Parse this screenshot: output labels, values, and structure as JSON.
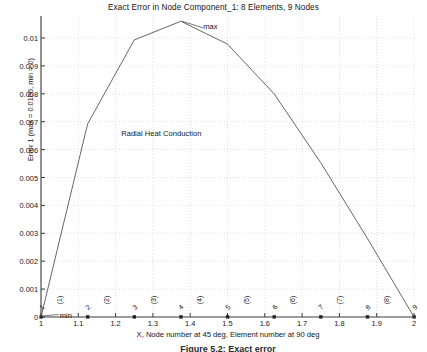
{
  "chart_data": {
    "type": "line",
    "title": "Exact Error in Node Component_1:   8 Elements, 9 Nodes",
    "xlabel": "X, Node number at 45 deg, Element number at 90 deg",
    "ylabel": "Error 1 (max = 0.0106, min = 0)",
    "grid": true,
    "legend": "none",
    "xlim": [
      1,
      2
    ],
    "ylim": [
      0,
      0.0106
    ],
    "xticks": [
      "1",
      "1.1",
      "1.2",
      "1.3",
      "1.4",
      "1.5",
      "1.6",
      "1.7",
      "1.8",
      "1.9",
      "2"
    ],
    "xtick_values": [
      1,
      1.1,
      1.2,
      1.3,
      1.4,
      1.5,
      1.6,
      1.7,
      1.8,
      1.9,
      2
    ],
    "yticks": [
      "0",
      "0.001",
      "0.002",
      "0.003",
      "0.004",
      "0.005",
      "0.006",
      "0.007",
      "0.008",
      "0.009",
      "0.01"
    ],
    "ytick_values": [
      0,
      0.001,
      0.002,
      0.003,
      0.004,
      0.005,
      0.006,
      0.007,
      0.008,
      0.009,
      0.01
    ],
    "x": [
      1,
      1.125,
      1.25,
      1.375,
      1.5,
      1.625,
      1.75,
      1.875,
      2
    ],
    "values": [
      0,
      0.00692,
      0.00993,
      0.0106,
      0.00978,
      0.008,
      0.00553,
      0.00282,
      0
    ],
    "series": [
      {
        "name": "Error 1",
        "x": [
          1,
          1.125,
          1.25,
          1.375,
          1.5,
          1.625,
          1.75,
          1.875,
          2
        ],
        "values": [
          0,
          0.00692,
          0.00993,
          0.0106,
          0.00978,
          0.008,
          0.00553,
          0.00282,
          0
        ],
        "color": "#555555"
      }
    ],
    "node_markers": {
      "x": [
        1,
        1.125,
        1.25,
        1.375,
        1.5,
        1.625,
        1.75,
        1.875,
        2
      ],
      "y": [
        0,
        0,
        0,
        0,
        0,
        0,
        0,
        0,
        0
      ],
      "labels": [
        "1",
        "2",
        "3",
        "4",
        "5",
        "6",
        "7",
        "8",
        "9"
      ],
      "rotation_deg": 45,
      "color": "#222222"
    },
    "element_markers": {
      "x": [
        1.0625,
        1.1875,
        1.3125,
        1.4375,
        1.5625,
        1.6875,
        1.8125,
        1.9375
      ],
      "labels": [
        "(1)",
        "(2)",
        "(3)",
        "(4)",
        "(5)",
        "(6)",
        "(7)",
        "(8)"
      ],
      "rotation_deg": 90
    },
    "annotations": [
      {
        "text": "max",
        "x": 1.375,
        "y": 0.0106,
        "label_x": 1.435,
        "label_y": 0.0104
      },
      {
        "text": "min",
        "x": 1.0,
        "y": 0.0,
        "label_x": 1.05,
        "label_y": 0.00025
      },
      {
        "text": "Radial  Heat Conduction",
        "x": 1.215,
        "y": 0.00655
      }
    ]
  },
  "figure": {
    "caption": "Figure 5.2: Exact error"
  },
  "style": {
    "axis_color": "#3a3a3a",
    "grid_color": "#c9c9c9",
    "curve_color": "#555555",
    "text_color": "#151515",
    "background": "#ffffff"
  }
}
